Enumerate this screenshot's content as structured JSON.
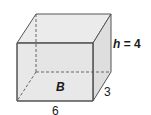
{
  "figure": {
    "type": "rectangular-prism",
    "labels": {
      "height_var": "h",
      "height_eq": " = 4",
      "base": "B",
      "depth": "3",
      "width": "6"
    },
    "colors": {
      "face_fill": "#e6e6e6",
      "top_fill": "#ebebeb",
      "side_fill": "#dedede",
      "edge": "#555555",
      "hidden_edge": "#666666"
    }
  }
}
